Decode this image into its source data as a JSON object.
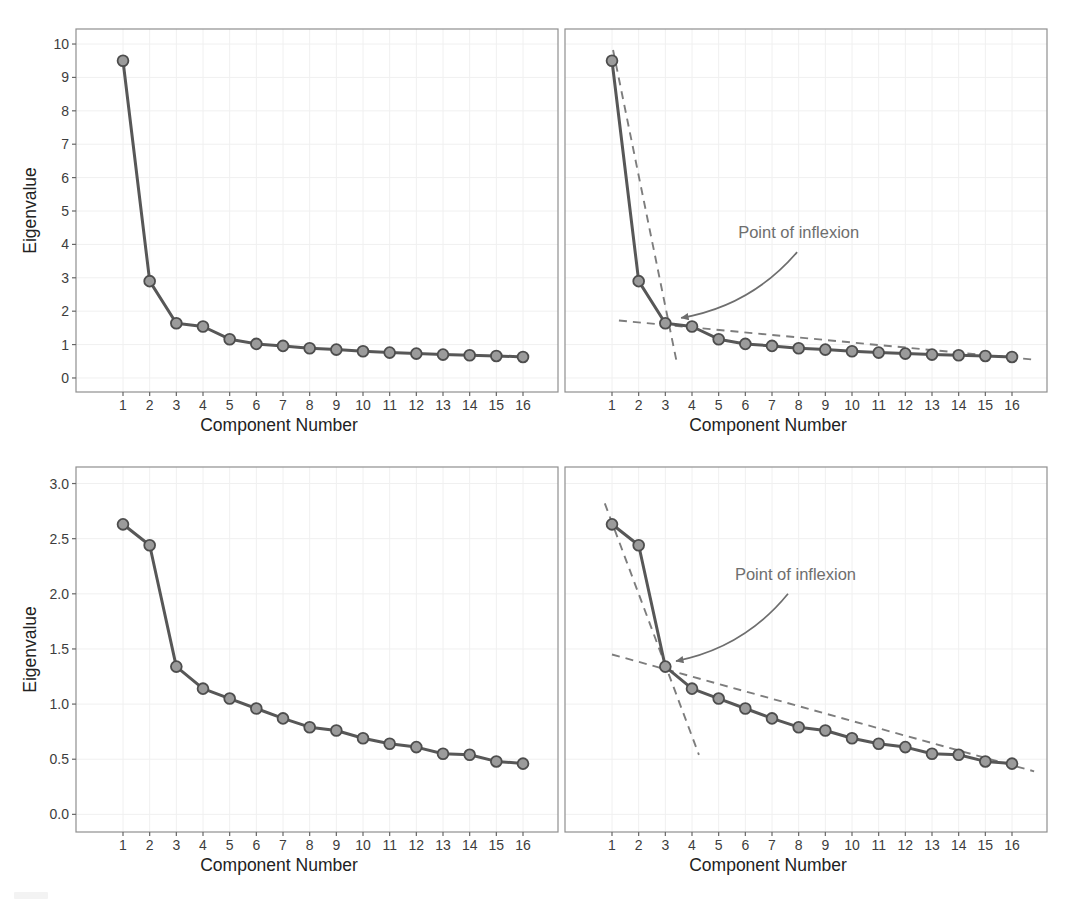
{
  "figure": {
    "colors": {
      "line": "#575757",
      "marker_fill": "#9b9b9b",
      "marker_stroke": "#4d4d4d",
      "dashed_line": "#7d7d7d",
      "annotation": "#6e6e6e",
      "panel_border": "#8f8f8f",
      "grid": "#f0f0f0",
      "tick": "#666666",
      "tick_label": "#3d3d3d",
      "axis_title": "#222222"
    }
  },
  "chart_data": [
    {
      "id": "top-left",
      "type": "line",
      "title": "",
      "xlabel": "Component Number",
      "ylabel": "Eigenvalue",
      "x": [
        1,
        2,
        3,
        4,
        5,
        6,
        7,
        8,
        9,
        10,
        11,
        12,
        13,
        14,
        15,
        16
      ],
      "values": [
        9.5,
        2.9,
        1.64,
        1.54,
        1.16,
        1.02,
        0.96,
        0.89,
        0.85,
        0.8,
        0.76,
        0.73,
        0.7,
        0.68,
        0.66,
        0.63
      ],
      "ylim": [
        -0.42,
        10.45
      ],
      "yticks": [
        0,
        1,
        2,
        3,
        4,
        5,
        6,
        7,
        8,
        9,
        10
      ],
      "ytick_labels": [
        "0",
        "1",
        "2",
        "3",
        "4",
        "5",
        "6",
        "7",
        "8",
        "9",
        "10"
      ],
      "show_y_tick_labels": true,
      "grid": true,
      "legend": null,
      "dashed_lines": [],
      "annotation": null
    },
    {
      "id": "top-right",
      "type": "line",
      "title": "",
      "xlabel": "Component Number",
      "ylabel": null,
      "x": [
        1,
        2,
        3,
        4,
        5,
        6,
        7,
        8,
        9,
        10,
        11,
        12,
        13,
        14,
        15,
        16
      ],
      "values": [
        9.5,
        2.9,
        1.64,
        1.54,
        1.16,
        1.02,
        0.96,
        0.89,
        0.85,
        0.8,
        0.76,
        0.73,
        0.7,
        0.68,
        0.66,
        0.63
      ],
      "ylim": [
        -0.42,
        10.45
      ],
      "yticks": [
        0,
        1,
        2,
        3,
        4,
        5,
        6,
        7,
        8,
        9,
        10
      ],
      "ytick_labels": [],
      "show_y_tick_labels": false,
      "grid": true,
      "legend": null,
      "dashed_lines": [
        {
          "x1": 1.04,
          "y1": 9.82,
          "x2": 3.41,
          "y2": 0.54
        },
        {
          "x1": 1.26,
          "y1": 1.72,
          "x2": 16.94,
          "y2": 0.54
        }
      ],
      "annotation": {
        "text": "Point of inflexion",
        "text_x": 8.0,
        "text_y": 4.34,
        "arrow_start_x": 7.94,
        "arrow_start_y": 3.77,
        "arrow_end_x": 3.59,
        "arrow_end_y": 1.8,
        "points_to_component": 3
      }
    },
    {
      "id": "bottom-left",
      "type": "line",
      "title": "",
      "xlabel": "Component Number",
      "ylabel": "Eigenvalue",
      "x": [
        1,
        2,
        3,
        4,
        5,
        6,
        7,
        8,
        9,
        10,
        11,
        12,
        13,
        14,
        15,
        16
      ],
      "values": [
        2.63,
        2.44,
        1.34,
        1.14,
        1.05,
        0.96,
        0.87,
        0.79,
        0.76,
        0.69,
        0.64,
        0.61,
        0.55,
        0.54,
        0.48,
        0.46
      ],
      "ylim": [
        -0.16,
        3.15
      ],
      "yticks": [
        0,
        0.5,
        1.0,
        1.5,
        2.0,
        2.5,
        3.0
      ],
      "ytick_labels": [
        "0.0",
        "0.5",
        "1.0",
        "1.5",
        "2.0",
        "2.5",
        "3.0"
      ],
      "show_y_tick_labels": true,
      "grid": true,
      "legend": null,
      "dashed_lines": [],
      "annotation": null
    },
    {
      "id": "bottom-right",
      "type": "line",
      "title": "",
      "xlabel": "Component Number",
      "ylabel": null,
      "x": [
        1,
        2,
        3,
        4,
        5,
        6,
        7,
        8,
        9,
        10,
        11,
        12,
        13,
        14,
        15,
        16
      ],
      "values": [
        2.63,
        2.44,
        1.34,
        1.14,
        1.05,
        0.96,
        0.87,
        0.79,
        0.76,
        0.69,
        0.64,
        0.61,
        0.55,
        0.54,
        0.48,
        0.46
      ],
      "ylim": [
        -0.16,
        3.15
      ],
      "yticks": [
        0,
        0.5,
        1.0,
        1.5,
        2.0,
        2.5,
        3.0
      ],
      "ytick_labels": [],
      "show_y_tick_labels": false,
      "grid": true,
      "legend": null,
      "dashed_lines": [
        {
          "x1": 0.73,
          "y1": 2.82,
          "x2": 4.26,
          "y2": 0.54
        },
        {
          "x1": 1.0,
          "y1": 1.45,
          "x2": 16.83,
          "y2": 0.39
        }
      ],
      "annotation": {
        "text": "Point of inflexion",
        "text_x": 7.88,
        "text_y": 2.17,
        "arrow_start_x": 7.6,
        "arrow_start_y": 2.0,
        "arrow_end_x": 3.4,
        "arrow_end_y": 1.39,
        "points_to_component": 3
      }
    }
  ]
}
